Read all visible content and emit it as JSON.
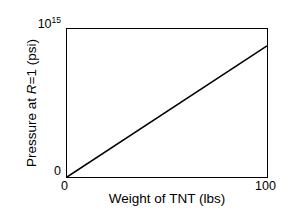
{
  "chart_data": {
    "type": "line",
    "title": "",
    "xlabel": "Weight of TNT (lbs)",
    "ylabel_parts": {
      "pre": "Pressure at ",
      "italic": "R",
      "post": "=1  (psi)"
    },
    "ylabel_plain": "Pressure at R=1  (psi)",
    "x": [
      0,
      100
    ],
    "values": [
      0,
      0.886
    ],
    "xlim": [
      0,
      100
    ],
    "ylim": [
      0,
      1
    ],
    "y_unit_exponent": "10^15 psi",
    "xticks": [
      "0",
      "100"
    ],
    "xtick_values": [
      0,
      100
    ],
    "yticks": [
      "0",
      "10^15"
    ],
    "ytick_top_mantissa": "10",
    "ytick_top_exponent": "15",
    "ytick_bottom": "0",
    "grid": false,
    "legend": false,
    "series": [
      {
        "name": "Pressure vs TNT weight",
        "x": [
          0,
          100
        ],
        "values": [
          0,
          0.886
        ],
        "color": "#000000"
      }
    ],
    "line_color": "#000000",
    "frame_color": "#000000",
    "background_color": "#ffffff",
    "annotation": "Linear relationship passing through the origin; at 100 lbs the pressure is just under 1x10^15 psi."
  }
}
